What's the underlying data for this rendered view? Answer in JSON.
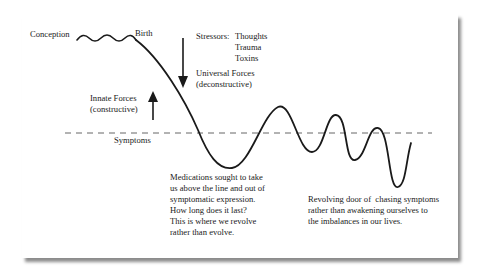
{
  "diagram": {
    "labels": {
      "conception": "Conception",
      "birth": "Birth",
      "stressors_heading": "Stressors:",
      "stressors": [
        "Thoughts",
        "Trauma",
        "Toxins"
      ],
      "universal_forces": "Universal Forces",
      "universal_forces_sub": "(deconstructive)",
      "innate_forces": "Innate Forces",
      "innate_forces_sub": "(constructive)",
      "symptoms": "Symptoms"
    },
    "annotations": {
      "medications": "Medications sought to take\nus above the line and out of\nsymptomatic expression.\nHow long does it last?\nThis is where we revolve\nrather than evolve.",
      "revolving_door": "Revolving door of  chasing symptoms\nrather than awakening ourselves to\nthe imbalances in our lives."
    },
    "arrows": [
      {
        "name": "universal-forces-arrow",
        "direction": "down"
      },
      {
        "name": "innate-forces-arrow",
        "direction": "up"
      }
    ],
    "colors": {
      "ink": "#1a1a1a",
      "dashed_line": "#555555",
      "background": "#ffffff"
    }
  }
}
